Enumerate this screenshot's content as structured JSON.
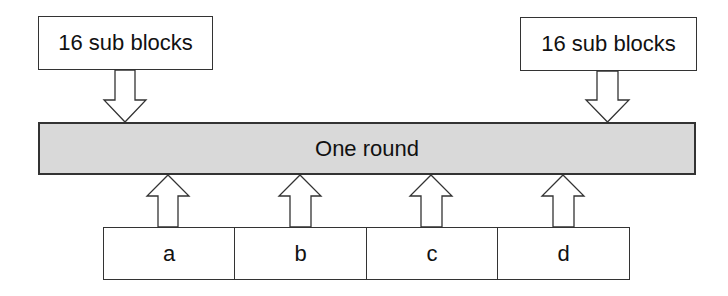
{
  "diagram": {
    "top_left_box": {
      "label": "16 sub blocks"
    },
    "top_right_box": {
      "label": "16 sub blocks"
    },
    "round_bar": {
      "label": "One round",
      "fill": "#d9d9d9"
    },
    "bottom_cells": [
      {
        "label": "a"
      },
      {
        "label": "b"
      },
      {
        "label": "c"
      },
      {
        "label": "d"
      }
    ],
    "arrows": {
      "down": [
        "16 sub blocks (left) -> One round",
        "16 sub blocks (right) -> One round"
      ],
      "up": [
        "a -> One round",
        "b -> One round",
        "c -> One round",
        "d -> One round"
      ]
    }
  }
}
